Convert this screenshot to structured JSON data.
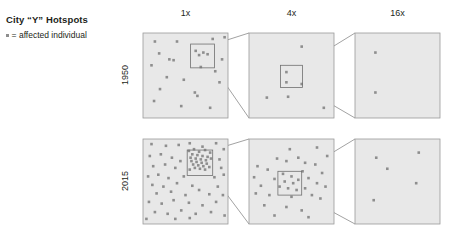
{
  "header": {
    "title": "City “Y” Hotspots",
    "legend_label": "= affected individual",
    "legend_marker": "square-dot-icon"
  },
  "columns": [
    {
      "id": "col-1x",
      "label": "1x",
      "cx": 186
    },
    {
      "id": "col-4x",
      "label": "4x",
      "cx": 292
    },
    {
      "id": "col-16x",
      "label": "16x",
      "cx": 398
    }
  ],
  "rows": [
    {
      "id": "row-1950",
      "label": "1950",
      "cy": 74
    },
    {
      "id": "row-2015",
      "label": "2015",
      "cy": 180
    }
  ],
  "style": {
    "panel_fill": "#e8e8e8",
    "panel_stroke": "#9a9a9a",
    "dot_color": "#8e8e8e",
    "zoombox_stroke": "#6f6f6f",
    "connector_stroke": "#7a7a7a",
    "text_color": "#231f20",
    "background": "#ffffff"
  },
  "chart_data": {
    "type": "scatter",
    "title": "City “Y” Hotspots",
    "legend": "= affected individual",
    "xlabel": "",
    "ylabel": "",
    "grid": false,
    "legend_position": "top-left",
    "magnifications": [
      "1x",
      "4x",
      "16x"
    ],
    "years": [
      "1950",
      "2015"
    ],
    "panel_geometry": {
      "x": [
        143,
        249,
        355
      ],
      "y": [
        33,
        139
      ],
      "w": 85,
      "h": 85
    },
    "point_counts": {
      "1950": {
        "1x": 22,
        "4x": 7,
        "16x": 2
      },
      "2015": {
        "1x": 68,
        "4x": 34,
        "16x": 5
      }
    },
    "panels": [
      {
        "id": "p-1950-1x",
        "year": "1950",
        "magnification": "1x",
        "zoom_box": {
          "x": 0.56,
          "y": 0.13,
          "w": 0.28,
          "h": 0.28
        },
        "points": [
          [
            0.14,
            0.1
          ],
          [
            0.4,
            0.1
          ],
          [
            0.82,
            0.07
          ],
          [
            0.96,
            0.05
          ],
          [
            0.19,
            0.24
          ],
          [
            0.62,
            0.21
          ],
          [
            0.66,
            0.26
          ],
          [
            0.71,
            0.23
          ],
          [
            0.76,
            0.25
          ],
          [
            0.31,
            0.31
          ],
          [
            0.36,
            0.32
          ],
          [
            0.93,
            0.31
          ],
          [
            0.1,
            0.38
          ],
          [
            0.68,
            0.4
          ],
          [
            0.85,
            0.45
          ],
          [
            0.28,
            0.52
          ],
          [
            0.48,
            0.55
          ],
          [
            0.9,
            0.58
          ],
          [
            0.2,
            0.66
          ],
          [
            0.61,
            0.7
          ],
          [
            0.64,
            0.74
          ],
          [
            0.13,
            0.8
          ],
          [
            0.45,
            0.86
          ],
          [
            0.79,
            0.88
          ]
        ]
      },
      {
        "id": "p-1950-4x",
        "year": "1950",
        "magnification": "4x",
        "zoom_box": {
          "x": 0.37,
          "y": 0.38,
          "w": 0.26,
          "h": 0.26
        },
        "points": [
          [
            0.62,
            0.16
          ],
          [
            0.44,
            0.46
          ],
          [
            0.44,
            0.58
          ],
          [
            0.62,
            0.6
          ],
          [
            0.21,
            0.76
          ],
          [
            0.46,
            0.75
          ],
          [
            0.88,
            0.88
          ]
        ]
      },
      {
        "id": "p-1950-16x",
        "year": "1950",
        "magnification": "16x",
        "zoom_box": null,
        "points": [
          [
            0.24,
            0.23
          ],
          [
            0.24,
            0.7
          ]
        ]
      },
      {
        "id": "p-2015-1x",
        "year": "2015",
        "magnification": "1x",
        "zoom_box": {
          "x": 0.52,
          "y": 0.13,
          "w": 0.3,
          "h": 0.3
        },
        "points": [
          [
            0.1,
            0.06
          ],
          [
            0.27,
            0.08
          ],
          [
            0.42,
            0.07
          ],
          [
            0.55,
            0.05
          ],
          [
            0.7,
            0.09
          ],
          [
            0.86,
            0.05
          ],
          [
            0.95,
            0.12
          ],
          [
            0.54,
            0.14
          ],
          [
            0.6,
            0.12
          ],
          [
            0.66,
            0.15
          ],
          [
            0.73,
            0.13
          ],
          [
            0.79,
            0.16
          ],
          [
            0.58,
            0.18
          ],
          [
            0.64,
            0.19
          ],
          [
            0.7,
            0.2
          ],
          [
            0.76,
            0.21
          ],
          [
            0.56,
            0.22
          ],
          [
            0.62,
            0.23
          ],
          [
            0.68,
            0.24
          ],
          [
            0.74,
            0.25
          ],
          [
            0.8,
            0.23
          ],
          [
            0.57,
            0.26
          ],
          [
            0.63,
            0.27
          ],
          [
            0.69,
            0.28
          ],
          [
            0.75,
            0.29
          ],
          [
            0.59,
            0.3
          ],
          [
            0.65,
            0.31
          ],
          [
            0.71,
            0.32
          ],
          [
            0.61,
            0.34
          ],
          [
            0.67,
            0.35
          ],
          [
            0.73,
            0.36
          ],
          [
            0.55,
            0.36
          ],
          [
            0.78,
            0.33
          ],
          [
            0.08,
            0.2
          ],
          [
            0.21,
            0.18
          ],
          [
            0.34,
            0.22
          ],
          [
            0.44,
            0.26
          ],
          [
            0.9,
            0.24
          ],
          [
            0.12,
            0.32
          ],
          [
            0.26,
            0.3
          ],
          [
            0.38,
            0.34
          ],
          [
            0.92,
            0.34
          ],
          [
            0.06,
            0.44
          ],
          [
            0.18,
            0.42
          ],
          [
            0.3,
            0.46
          ],
          [
            0.48,
            0.44
          ],
          [
            0.84,
            0.45
          ],
          [
            0.95,
            0.42
          ],
          [
            0.11,
            0.54
          ],
          [
            0.24,
            0.56
          ],
          [
            0.4,
            0.52
          ],
          [
            0.58,
            0.55
          ],
          [
            0.88,
            0.56
          ],
          [
            0.16,
            0.64
          ],
          [
            0.33,
            0.62
          ],
          [
            0.5,
            0.66
          ],
          [
            0.66,
            0.6
          ],
          [
            0.78,
            0.65
          ],
          [
            0.94,
            0.66
          ],
          [
            0.07,
            0.74
          ],
          [
            0.22,
            0.76
          ],
          [
            0.36,
            0.72
          ],
          [
            0.54,
            0.75
          ],
          [
            0.7,
            0.78
          ],
          [
            0.86,
            0.74
          ],
          [
            0.14,
            0.86
          ],
          [
            0.29,
            0.88
          ],
          [
            0.45,
            0.84
          ],
          [
            0.62,
            0.88
          ],
          [
            0.8,
            0.86
          ],
          [
            0.96,
            0.9
          ],
          [
            0.04,
            0.94
          ],
          [
            0.38,
            0.94
          ],
          [
            0.55,
            0.93
          ]
        ]
      },
      {
        "id": "p-2015-4x",
        "year": "2015",
        "magnification": "4x",
        "zoom_box": {
          "x": 0.34,
          "y": 0.38,
          "w": 0.28,
          "h": 0.28
        },
        "points": [
          [
            0.48,
            0.12
          ],
          [
            0.8,
            0.1
          ],
          [
            0.92,
            0.2
          ],
          [
            0.33,
            0.23
          ],
          [
            0.44,
            0.26
          ],
          [
            0.58,
            0.22
          ],
          [
            0.66,
            0.28
          ],
          [
            0.78,
            0.3
          ],
          [
            0.1,
            0.32
          ],
          [
            0.22,
            0.36
          ],
          [
            0.4,
            0.41
          ],
          [
            0.5,
            0.44
          ],
          [
            0.63,
            0.38
          ],
          [
            0.86,
            0.4
          ],
          [
            0.06,
            0.45
          ],
          [
            0.3,
            0.47
          ],
          [
            0.42,
            0.5
          ],
          [
            0.52,
            0.52
          ],
          [
            0.58,
            0.48
          ],
          [
            0.7,
            0.46
          ],
          [
            0.8,
            0.52
          ],
          [
            0.14,
            0.55
          ],
          [
            0.36,
            0.56
          ],
          [
            0.46,
            0.58
          ],
          [
            0.56,
            0.6
          ],
          [
            0.66,
            0.58
          ],
          [
            0.9,
            0.56
          ],
          [
            0.08,
            0.64
          ],
          [
            0.24,
            0.66
          ],
          [
            0.5,
            0.68
          ],
          [
            0.74,
            0.66
          ],
          [
            0.84,
            0.7
          ],
          [
            0.18,
            0.78
          ],
          [
            0.44,
            0.8
          ],
          [
            0.62,
            0.84
          ],
          [
            0.3,
            0.9
          ],
          [
            0.7,
            0.92
          ]
        ]
      },
      {
        "id": "p-2015-16x",
        "year": "2015",
        "magnification": "16x",
        "zoom_box": null,
        "points": [
          [
            0.25,
            0.22
          ],
          [
            0.38,
            0.35
          ],
          [
            0.75,
            0.16
          ],
          [
            0.72,
            0.52
          ],
          [
            0.22,
            0.72
          ]
        ]
      }
    ],
    "connectors": [
      {
        "from": "p-1950-1x",
        "to": "p-1950-4x"
      },
      {
        "from": "p-1950-4x",
        "to": "p-1950-16x"
      },
      {
        "from": "p-2015-1x",
        "to": "p-2015-4x"
      },
      {
        "from": "p-2015-4x",
        "to": "p-2015-16x"
      }
    ]
  }
}
